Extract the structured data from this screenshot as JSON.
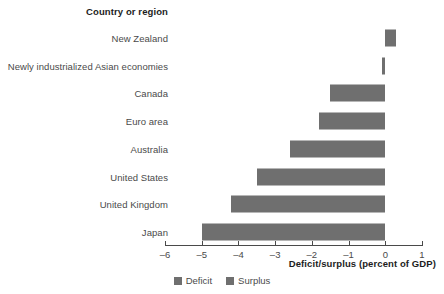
{
  "header": {
    "column_title": "Country or region"
  },
  "axis": {
    "title": "Deficit/surplus (percent of GDP)",
    "tick_labels": [
      "–6",
      "–5",
      "–4",
      "–3",
      "–2",
      "–1",
      "0",
      "1"
    ]
  },
  "legend": {
    "items": [
      {
        "label": "Deficit",
        "color": "#6f6f6f"
      },
      {
        "label": "Surplus",
        "color": "#6f6f6f"
      }
    ]
  },
  "colors": {
    "bar": "#6f6f6f",
    "axis": "#4a4a4a",
    "label": "#4a4a4a",
    "heading": "#1d1d1d",
    "background": "#ffffff"
  },
  "chart_data": {
    "type": "bar",
    "orientation": "horizontal",
    "title": "",
    "xlabel": "Deficit/surplus (percent of GDP)",
    "ylabel": "Country or region",
    "xlim": [
      -6,
      1
    ],
    "xticks": [
      -6,
      -5,
      -4,
      -3,
      -2,
      -1,
      0,
      1
    ],
    "grid": false,
    "legend_position": "bottom-center",
    "categories": [
      "New Zealand",
      "Newly industrialized Asian economies",
      "Canada",
      "Euro area",
      "Australia",
      "United States",
      "United Kingdom",
      "Japan"
    ],
    "values": [
      0.3,
      -0.1,
      -1.5,
      -1.8,
      -2.6,
      -3.5,
      -4.2,
      -5.0
    ],
    "series": [
      {
        "name": "Deficit/surplus (percent of GDP)",
        "values": [
          0.3,
          -0.1,
          -1.5,
          -1.8,
          -2.6,
          -3.5,
          -4.2,
          -5.0
        ]
      }
    ]
  }
}
